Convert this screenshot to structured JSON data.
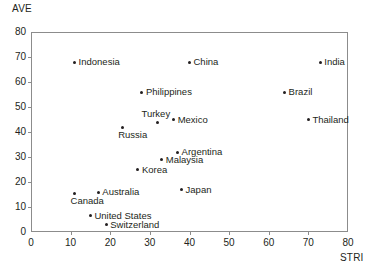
{
  "chart_data": {
    "type": "scatter",
    "title": "",
    "xlabel": "STRI",
    "ylabel": "AVE",
    "xlim": [
      0,
      80
    ],
    "ylim": [
      0,
      80
    ],
    "xticks": [
      0,
      10,
      20,
      30,
      40,
      50,
      60,
      70,
      80
    ],
    "yticks": [
      0,
      10,
      20,
      30,
      40,
      50,
      60,
      70,
      80
    ],
    "grid": false,
    "legend": "none",
    "marker_color": "#231f20",
    "frame_color": "#8c8c8c",
    "points": [
      {
        "label": "Indonesia",
        "x": 11,
        "y": 68,
        "label_pos": "right"
      },
      {
        "label": "China",
        "x": 40,
        "y": 68,
        "label_pos": "right"
      },
      {
        "label": "India",
        "x": 73,
        "y": 68,
        "label_pos": "right"
      },
      {
        "label": "Philippines",
        "x": 28,
        "y": 56,
        "label_pos": "right"
      },
      {
        "label": "Brazil",
        "x": 64,
        "y": 56,
        "label_pos": "right"
      },
      {
        "label": "Turkey",
        "x": 32,
        "y": 44,
        "label_pos": "above"
      },
      {
        "label": "Mexico",
        "x": 36,
        "y": 45,
        "label_pos": "right"
      },
      {
        "label": "Thailand",
        "x": 70,
        "y": 45,
        "label_pos": "right"
      },
      {
        "label": "Russia",
        "x": 23,
        "y": 42,
        "label_pos": "below-right"
      },
      {
        "label": "Argentina",
        "x": 37,
        "y": 32,
        "label_pos": "right"
      },
      {
        "label": "Malaysia",
        "x": 33,
        "y": 29,
        "label_pos": "right"
      },
      {
        "label": "Korea",
        "x": 27,
        "y": 25,
        "label_pos": "right"
      },
      {
        "label": "Australia",
        "x": 17,
        "y": 16,
        "label_pos": "right"
      },
      {
        "label": "Japan",
        "x": 38,
        "y": 17,
        "label_pos": "right"
      },
      {
        "label": "Canada",
        "x": 11,
        "y": 15.5,
        "label_pos": "below-right"
      },
      {
        "label": "United States",
        "x": 15,
        "y": 6.5,
        "label_pos": "right"
      },
      {
        "label": "Switzerland",
        "x": 19,
        "y": 3,
        "label_pos": "right"
      }
    ]
  }
}
